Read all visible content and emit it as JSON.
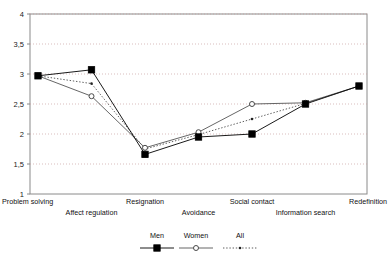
{
  "chart_data": {
    "type": "line",
    "title": "",
    "subtitle": "",
    "xlabel": "",
    "ylabel": "",
    "ylim": [
      1,
      4
    ],
    "ytick_labels": [
      "1",
      "1,5",
      "2",
      "2,5",
      "3",
      "3,5",
      "4"
    ],
    "ytick_values": [
      1,
      1.5,
      2,
      2.5,
      3,
      3.5,
      4
    ],
    "grid": "horizontal-dotted",
    "legend_position": "bottom-center",
    "categories": [
      "Problem solving",
      "Affect regulation",
      "Resignation",
      "Avoidance",
      "Social contact",
      "Information search",
      "Redefinition"
    ],
    "category_label_rows": [
      0,
      1,
      0,
      1,
      0,
      1,
      0
    ],
    "series": [
      {
        "name": "Men",
        "marker": "filled-square",
        "line": "solid",
        "color": "#000000",
        "values": [
          2.97,
          3.07,
          1.66,
          1.95,
          2.0,
          2.5,
          2.8
        ]
      },
      {
        "name": "Women",
        "marker": "open-circle",
        "line": "solid",
        "color": "#555555",
        "values": [
          2.97,
          2.63,
          1.77,
          2.03,
          2.5,
          2.52,
          2.8
        ]
      },
      {
        "name": "All",
        "marker": "small-dot",
        "line": "dotted",
        "color": "#333333",
        "values": [
          2.97,
          2.84,
          1.75,
          1.99,
          2.25,
          2.51,
          2.8
        ]
      }
    ]
  },
  "legend": {
    "entries": [
      {
        "label": "Men"
      },
      {
        "label": "Women"
      },
      {
        "label": "All"
      }
    ]
  },
  "axis": {
    "frame_color": "#8a8a8a",
    "grid_color": "#c8a0a0"
  }
}
